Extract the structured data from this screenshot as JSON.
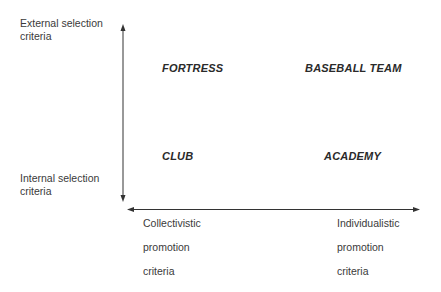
{
  "y_axis": {
    "top_label": "External selection\ncriteria",
    "top_label_lines": [
      "External selection",
      "criteria"
    ],
    "bottom_label_lines": [
      "Internal selection",
      "criteria"
    ]
  },
  "x_axis": {
    "left_label_lines": [
      "Collectivistic",
      "promotion",
      "criteria"
    ],
    "right_label_lines": [
      "Individualistic",
      "promotion",
      "criteria"
    ]
  },
  "quadrants": {
    "top_left": "FORTRESS",
    "top_right": "BASEBALL TEAM",
    "bottom_left": "CLUB",
    "bottom_right": "ACADEMY"
  },
  "colors": {
    "axis": "#333333",
    "text": "#3a3a3a"
  }
}
